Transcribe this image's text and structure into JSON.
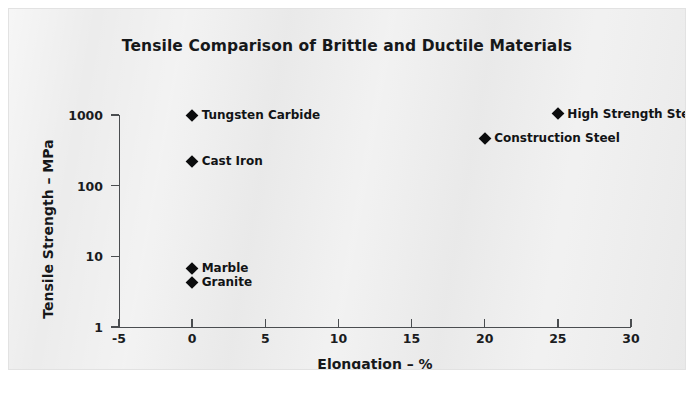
{
  "figure": {
    "number": "3.3",
    "background_color": "#ececec",
    "marker_color": "#0b0c0d",
    "axis_color": "#4a4d50",
    "text_color": "#16181a"
  },
  "chart_data": {
    "type": "scatter",
    "title": "Tensile Comparison of Brittle and Ductile Materials",
    "xlabel": "Elongation – %",
    "ylabel": "Tensile Strength – MPa",
    "xlim": [
      -5,
      30
    ],
    "ylim": [
      1,
      1000
    ],
    "yscale": "log",
    "xscale": "linear",
    "grid": false,
    "legend": "none (points labelled inline)",
    "xticks": [
      "-5",
      "0",
      "5",
      "10",
      "15",
      "20",
      "25",
      "30"
    ],
    "xtick_values": [
      -5,
      0,
      5,
      10,
      15,
      20,
      25,
      30
    ],
    "yticks": [
      "1",
      "10",
      "100",
      "1000"
    ],
    "ytick_values": [
      1,
      10,
      100,
      1000
    ],
    "points": [
      {
        "label": "Tungsten Carbide",
        "x": 0,
        "y": 1000,
        "label_side": "right"
      },
      {
        "label": "Cast Iron",
        "x": 0,
        "y": 220,
        "label_side": "right"
      },
      {
        "label": "Marble",
        "x": 0,
        "y": 6.8,
        "label_side": "right"
      },
      {
        "label": "Granite",
        "x": 0,
        "y": 4.3,
        "label_side": "right"
      },
      {
        "label": "Construction Steel",
        "x": 20,
        "y": 470,
        "label_side": "right"
      },
      {
        "label": "High Strength Steel",
        "x": 25,
        "y": 1050,
        "label_side": "right"
      }
    ]
  }
}
